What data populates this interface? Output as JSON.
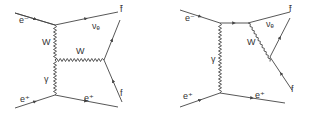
{
  "diagrams": [
    {
      "name": "left-diagram",
      "labels": {
        "e_minus": "e⁻",
        "nu_e": "νₑ",
        "f_bar": "f̄",
        "w_vertical": "W",
        "w_horizontal": "W",
        "gamma": "γ",
        "e_plus_in": "e⁺",
        "e_plus_out": "e⁺",
        "f": "f"
      }
    },
    {
      "name": "right-diagram",
      "labels": {
        "e_minus": "e⁻",
        "nu_e": "νₑ",
        "f_bar": "f̄",
        "w_diag": "W",
        "gamma": "γ",
        "e_plus_in": "e⁺",
        "e_plus_out": "e⁺",
        "f": "f"
      }
    }
  ],
  "colors": {
    "line": "#444444",
    "text": "#333333"
  }
}
